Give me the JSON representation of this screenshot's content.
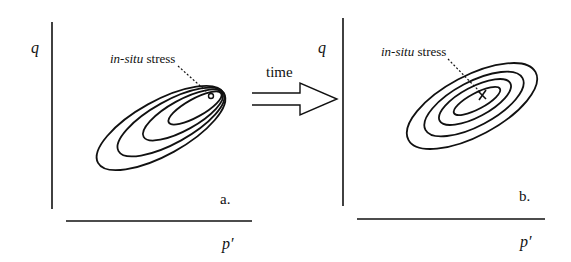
{
  "panels": [
    {
      "id": "a",
      "label": "a.",
      "y_axis_label": "q",
      "x_axis_label": "p′",
      "annotation_italic": "in-situ",
      "annotation_rest": " stress",
      "description": "Nested eccentric ellipses converging at the in-situ stress point (top-right)"
    },
    {
      "id": "b",
      "label": "b.",
      "y_axis_label": "q",
      "x_axis_label": "p′",
      "annotation_italic": "in-situ",
      "annotation_rest": " stress",
      "description": "Concentric ellipses centered on the in-situ stress point (marked by a cross)"
    }
  ],
  "arrow": {
    "label": "time"
  },
  "colors": {
    "ink": "#111111",
    "background": "#ffffff"
  }
}
